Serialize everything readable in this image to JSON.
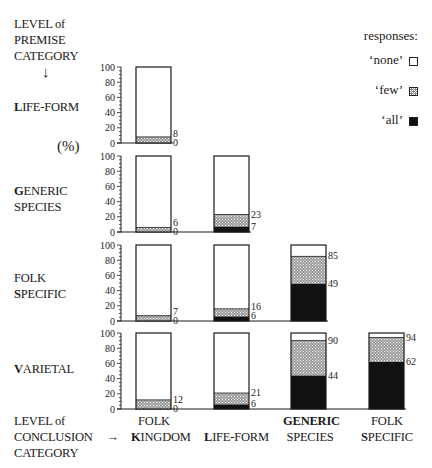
{
  "premise_header": {
    "line1": "LEVEL of",
    "line2": "PREMISE",
    "line3": "CATEGORY",
    "arrow": "↓"
  },
  "percent_label": "(%)",
  "conclusion_header": {
    "line1": "LEVEL of",
    "line2": "CONCLUSION",
    "line3": "CATEGORY",
    "arrow": "→"
  },
  "row_labels": [
    {
      "initial": "L",
      "rest": "IFE-FORM",
      "line2_initial": "",
      "line2_rest": ""
    },
    {
      "initial": "G",
      "rest": "ENERIC",
      "line2_initial": "",
      "line2_rest": "SPECIES"
    },
    {
      "initial": "",
      "rest": "FOLK",
      "line2_initial": "S",
      "line2_rest": "PECIFIC"
    },
    {
      "initial": "V",
      "rest": "ARIETAL",
      "line2_initial": "",
      "line2_rest": ""
    }
  ],
  "column_labels": [
    {
      "line1": "FOLK",
      "line2_initial": "K",
      "line2_rest": "INGDOM"
    },
    {
      "line1": "",
      "line2_initial": "L",
      "line2_rest": "IFE-FORM"
    },
    {
      "line1": "GENERIC",
      "line2_initial": "",
      "line2_rest": "SPECIES"
    },
    {
      "line1": "FOLK",
      "line2_initial": "S",
      "line2_rest": "PECIFIC"
    }
  ],
  "legend": {
    "title": "responses:",
    "items": [
      {
        "label": "‘none’",
        "key": "none"
      },
      {
        "label": "‘few’",
        "key": "few"
      },
      {
        "label": "‘all’",
        "key": "all"
      }
    ]
  },
  "axis_ticks": [
    "100",
    "80",
    "60",
    "40",
    "20",
    "0"
  ],
  "colors": {
    "none": "#ffffff",
    "few": "#8a8a8a",
    "all": "#111111",
    "stroke": "#1a1a1a"
  },
  "chart_data": {
    "type": "bar",
    "subtype": "stacked-percent-small-multiples",
    "title": "",
    "ylabel": "(%)",
    "ylim": [
      0,
      100
    ],
    "yticks": [
      0,
      20,
      40,
      60,
      80,
      100
    ],
    "grid": false,
    "legend_position": "top-right",
    "legend_title": "responses:",
    "legend": [
      "'none'",
      "'few'",
      "'all'"
    ],
    "row_axis_label": "LEVEL of PREMISE CATEGORY",
    "column_axis_label": "LEVEL of CONCLUSION CATEGORY",
    "rows": [
      "LIFE-FORM",
      "GENERIC SPECIES",
      "FOLK SPECIFIC",
      "VARIETAL"
    ],
    "columns": [
      "FOLK KINGDOM",
      "LIFE-FORM",
      "GENERIC SPECIES",
      "FOLK SPECIFIC"
    ],
    "note": "Each bar: 'all' from 0 to lower label, 'few' from lower label to upper label (cumulative), 'none' remainder to 100.",
    "panels": [
      {
        "premise": "LIFE-FORM",
        "bars": [
          {
            "conclusion": "FOLK KINGDOM",
            "all": 0,
            "all_plus_few": 8
          }
        ]
      },
      {
        "premise": "GENERIC SPECIES",
        "bars": [
          {
            "conclusion": "FOLK KINGDOM",
            "all": 0,
            "all_plus_few": 6
          },
          {
            "conclusion": "LIFE-FORM",
            "all": 7,
            "all_plus_few": 23
          }
        ]
      },
      {
        "premise": "FOLK SPECIFIC",
        "bars": [
          {
            "conclusion": "FOLK KINGDOM",
            "all": 0,
            "all_plus_few": 7
          },
          {
            "conclusion": "LIFE-FORM",
            "all": 6,
            "all_plus_few": 16
          },
          {
            "conclusion": "GENERIC SPECIES",
            "all": 49,
            "all_plus_few": 85
          }
        ]
      },
      {
        "premise": "VARIETAL",
        "bars": [
          {
            "conclusion": "FOLK KINGDOM",
            "all": 0,
            "all_plus_few": 12
          },
          {
            "conclusion": "LIFE-FORM",
            "all": 6,
            "all_plus_few": 21
          },
          {
            "conclusion": "GENERIC SPECIES",
            "all": 44,
            "all_plus_few": 90
          },
          {
            "conclusion": "FOLK SPECIFIC",
            "all": 62,
            "all_plus_few": 94
          }
        ]
      }
    ]
  }
}
